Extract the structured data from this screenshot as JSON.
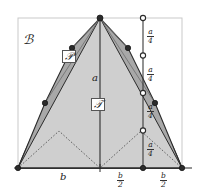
{
  "figure": {
    "colors": {
      "outline": "#2b2b2b",
      "frame": "#c9c9c9",
      "band_fill": "#9d9d9d",
      "triangle_fill": "#cfcfcf",
      "region_fill": "#d9d9d9",
      "marker_fill": "#2b2b2b",
      "marker_open_fill": "#ffffff",
      "dotted": "#555555",
      "background": "#ffffff"
    },
    "labels": {
      "region_B": "ℬ",
      "polygon_P": "𝒫",
      "triangle_T": "𝒯",
      "height_a": "a",
      "base_b": "b",
      "half_base": {
        "num": "b",
        "den": "2"
      },
      "quarter_height": {
        "num": "a",
        "den": "4"
      }
    },
    "right_axis": {
      "segment_label_count": 4,
      "segment_labels": [
        {
          "num": "a",
          "den": "4"
        },
        {
          "num": "a",
          "den": "4"
        },
        {
          "num": "a",
          "den": "4"
        },
        {
          "num": "a",
          "den": "4"
        }
      ],
      "node_count": 5,
      "node_style": [
        "open",
        "open",
        "open",
        "open",
        "filled"
      ]
    },
    "bottom_axis": {
      "labels": [
        "b",
        "b/2",
        "b/2"
      ]
    },
    "geometry": {
      "apex": [
        100,
        18
      ],
      "left_base": [
        18,
        168
      ],
      "right_base": [
        182,
        168
      ],
      "polygon_vertices_left": [
        [
          18,
          168
        ],
        [
          45,
          103
        ],
        [
          72,
          48
        ],
        [
          100,
          18
        ]
      ],
      "polygon_vertices_right": [
        [
          100,
          18
        ],
        [
          128,
          48
        ],
        [
          155,
          103
        ],
        [
          182,
          168
        ]
      ]
    }
  }
}
